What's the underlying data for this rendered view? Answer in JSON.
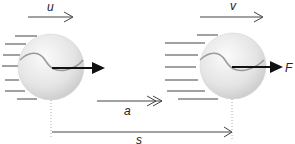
{
  "diagram": {
    "labels": {
      "initial_velocity": "u",
      "final_velocity": "v",
      "acceleration": "a",
      "displacement": "s",
      "force": "F"
    },
    "colors": {
      "ball_fill": "#e6e6e6",
      "ball_highlight": "#f7f7f7",
      "seam": "#9a9a9a",
      "arrow": "#111111",
      "line": "#555555",
      "dotted": "#aaaaaa"
    }
  }
}
